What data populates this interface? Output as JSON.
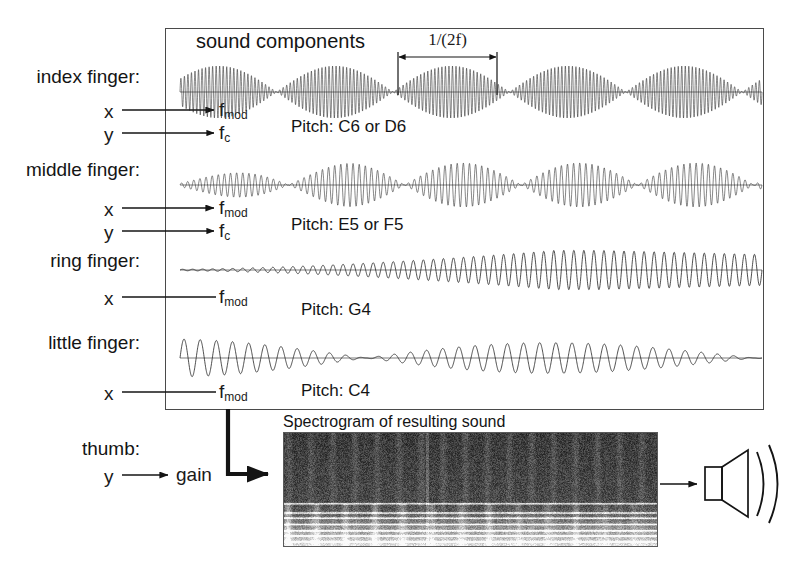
{
  "figure": {
    "panel_title": "sound components",
    "period_annotation": "1/(2f)",
    "spectrogram_caption": "Spectrogram of resulting sound",
    "output_icon": "speaker-icon",
    "arrow_icon": "arrow-right-icon"
  },
  "rows": [
    {
      "id": "index-finger",
      "finger_label": "index finger:",
      "mappings": [
        {
          "axis": "x",
          "target": "f",
          "target_sub": "mod",
          "arrowhead": true
        },
        {
          "axis": "y",
          "target": "f",
          "target_sub": "c",
          "arrowhead": true
        }
      ],
      "pitch": "Pitch: C6 or D6"
    },
    {
      "id": "middle-finger",
      "finger_label": "middle finger:",
      "mappings": [
        {
          "axis": "x",
          "target": "f",
          "target_sub": "mod",
          "arrowhead": true
        },
        {
          "axis": "y",
          "target": "f",
          "target_sub": "c",
          "arrowhead": true
        }
      ],
      "pitch": "Pitch: E5 or F5"
    },
    {
      "id": "ring-finger",
      "finger_label": "ring finger:",
      "mappings": [
        {
          "axis": "x",
          "target": "f",
          "target_sub": "mod",
          "arrowhead": false
        }
      ],
      "pitch": "Pitch: G4"
    },
    {
      "id": "little-finger",
      "finger_label": "little finger:",
      "mappings": [
        {
          "axis": "x",
          "target": "f",
          "target_sub": "mod",
          "arrowhead": false
        }
      ],
      "pitch": "Pitch: C4"
    }
  ],
  "thumb": {
    "finger_label": "thumb:",
    "axis": "y",
    "target": "gain"
  },
  "colors": {
    "ink": "#141414",
    "frame": "#4a4a4a",
    "wave": "#222222",
    "spectrogram_dark": "#3a3a3a",
    "spectrogram_light": "#e8e8e8",
    "background": "#ffffff"
  },
  "chart_data": {
    "type": "line",
    "title": "sound components",
    "traces": [
      {
        "name": "index finger",
        "carrier_pitch": "C6 or D6",
        "carrier_hz": 1047,
        "mod_cycles_visible": 5.0,
        "carrier_cycles_visible": 165,
        "envelope": "sinusoidal AM, full depth, constant",
        "baseline_y": 92,
        "amplitude_px": 26,
        "x_range": [
          180,
          762
        ]
      },
      {
        "name": "middle finger",
        "carrier_pitch": "E5 or F5",
        "carrier_hz": 659,
        "mod_cycles_visible": 5.0,
        "carrier_cycles_visible": 95,
        "envelope": "sinusoidal AM, full depth, rising then steady",
        "baseline_y": 185,
        "amplitude_px": 22,
        "x_range": [
          180,
          762
        ]
      },
      {
        "name": "ring finger",
        "carrier_pitch": "G4",
        "carrier_hz": 392,
        "mod_cycles_visible": 0.5,
        "carrier_cycles_visible": 58,
        "envelope": "slow swell from zero to full then slight decay",
        "baseline_y": 270,
        "amplitude_px": 18,
        "x_range": [
          180,
          762
        ]
      },
      {
        "name": "little finger",
        "carrier_pitch": "C4",
        "carrier_hz": 262,
        "mod_cycles_visible": 1.5,
        "carrier_cycles_visible": 36,
        "envelope": "starts full, decays to zero, swells again",
        "baseline_y": 358,
        "amplitude_px": 19,
        "x_range": [
          180,
          762
        ]
      }
    ],
    "annotations": [
      {
        "text": "1/(2f)",
        "type": "dimension",
        "x_from": 398,
        "x_to": 497,
        "y": 58
      }
    ],
    "spectrogram": {
      "caption": "Spectrogram of resulting sound",
      "x": 283,
      "y": 432,
      "width": 375,
      "height": 115,
      "xlabel": "time",
      "ylabel": "frequency",
      "band_count": 6
    },
    "xlabel": "time",
    "ylabel": "amplitude",
    "grid": false,
    "legend": "none"
  }
}
